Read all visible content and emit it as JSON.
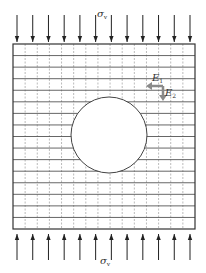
{
  "diagram": {
    "top_load_label": "σ",
    "top_load_sub": "v",
    "bottom_load_label": "σ",
    "bottom_load_sub": "v",
    "e1_label": "E",
    "e1_sub": "1",
    "e2_label": "E",
    "e2_sub": "2",
    "arrow_count_top": 12,
    "arrow_count_bottom": 12,
    "grid_columns": 15,
    "grid_rows": 16,
    "colors": {
      "frame": "#333333",
      "grid_solid": "#555555",
      "grid_dashed": "#aaaaaa",
      "arrows": "#222222",
      "direction_arrows": "#8a8a8a",
      "hole_fill": "#ffffff"
    }
  }
}
